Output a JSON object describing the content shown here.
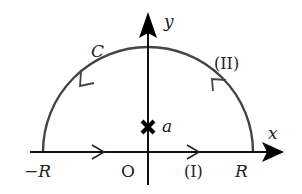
{
  "diagram": {
    "colors": {
      "axis": "#111111",
      "contour": "#444444",
      "text": "#222222",
      "pole": "#000000"
    },
    "axes": {
      "x_label": "x",
      "y_label": "y",
      "origin_label": "O"
    },
    "contour": {
      "name": "C",
      "segment_1_label": "(I)",
      "segment_2_label": "(II)",
      "left_end_label": "−R",
      "right_end_label": "R"
    },
    "pole": {
      "label": "a",
      "marker": "cross"
    }
  }
}
